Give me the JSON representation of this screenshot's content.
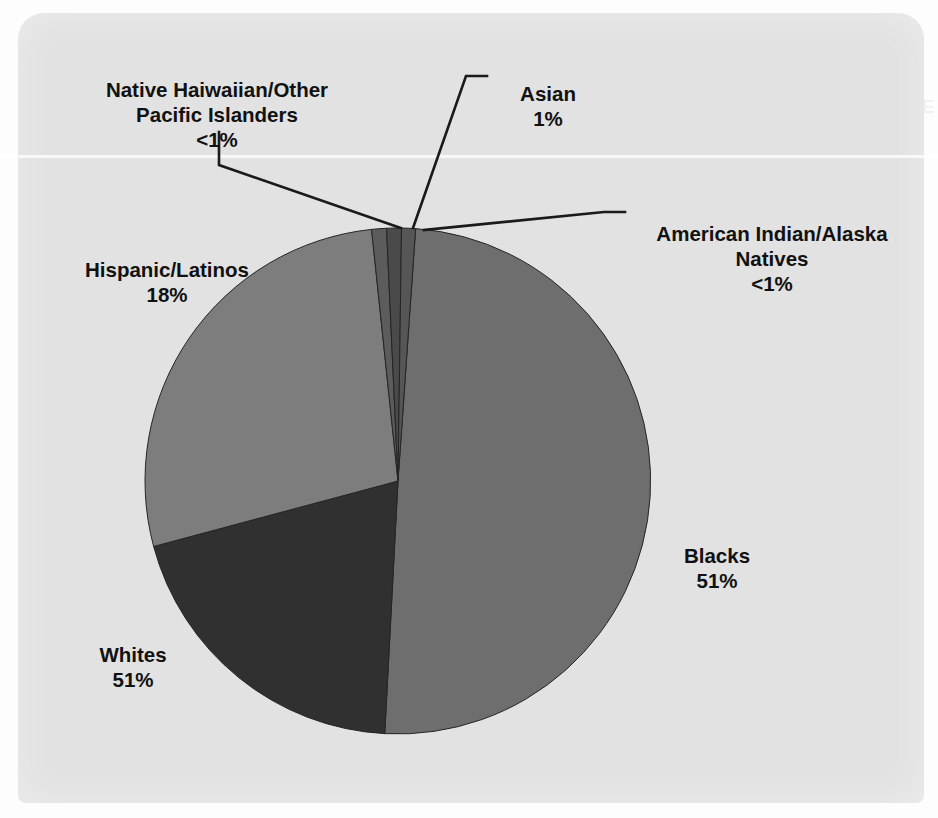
{
  "chart_data": {
    "type": "pie",
    "title": "",
    "subtitle": "",
    "xlabel": "",
    "ylabel": "",
    "legend_position": "none",
    "labels_position": "callout",
    "grid": false,
    "categories": [
      "Blacks",
      "Whites",
      "Hispanic/Latinos",
      "Asian",
      "Native Haiwaiian/Other Pacific Islanders",
      "American Indian/Alaska Natives"
    ],
    "values": [
      51,
      51,
      18,
      1,
      0.5,
      0.5
    ],
    "value_labels": [
      "51%",
      "51%",
      "18%",
      "1%",
      "<1%",
      "<1%"
    ],
    "colors": [
      "#6e6e6e",
      "#303030",
      "#7d7d7d",
      "#4a4a4a",
      "#5c5c5c",
      "#565656"
    ],
    "slices": [
      {
        "name": "Blacks",
        "value": 51,
        "value_label": "51%",
        "color": "#6e6e6e",
        "start_angle_deg": 4.0,
        "end_angle_deg": 183.0
      },
      {
        "name": "Whites",
        "value": 51,
        "value_label": "51%",
        "color": "#303030",
        "start_angle_deg": 183.0,
        "end_angle_deg": 255.0
      },
      {
        "name": "Hispanic/Latinos",
        "value": 18,
        "value_label": "18%",
        "color": "#7d7d7d",
        "start_angle_deg": 255.0,
        "end_angle_deg": 354.0
      },
      {
        "name": "Native Haiwaiian/Other Pacific Islanders",
        "value": 0.5,
        "value_label": "<1%",
        "color": "#5c5c5c",
        "start_angle_deg": 354.0,
        "end_angle_deg": 357.4
      },
      {
        "name": "Asian",
        "value": 1,
        "value_label": "1%",
        "color": "#4a4a4a",
        "start_angle_deg": 357.4,
        "end_angle_deg": 360.8
      },
      {
        "name": "American Indian/Alaska Natives",
        "value": 0.5,
        "value_label": "<1%",
        "color": "#565656",
        "start_angle_deg": 360.8,
        "end_angle_deg": 364.0
      }
    ]
  },
  "labels": {
    "nhopi": {
      "name": "Native Haiwaiian/Other\nPacific Islanders",
      "pct": "<1%"
    },
    "asian": {
      "name": "Asian",
      "pct": "1%"
    },
    "aian": {
      "name": "American Indian/Alaska\nNatives",
      "pct": "<1%"
    },
    "hispanic": {
      "name": "Hispanic/Latinos",
      "pct": "18%"
    },
    "whites": {
      "name": "Whites",
      "pct": "51%"
    },
    "blacks": {
      "name": "Blacks",
      "pct": "51%"
    }
  },
  "palette": {
    "page_background": "#fdfdfd",
    "panel_background": "#e2e2e2",
    "text": "#111111",
    "leader_line": "#1a1a1a",
    "blacks_slice": "#6e6e6e",
    "whites_slice": "#303030",
    "hispanic_slice": "#7d7d7d",
    "asian_slice": "#4a4a4a",
    "nhopi_slice": "#5c5c5c",
    "aian_slice": "#565656"
  },
  "ghost_text": {
    "line1": "CLOSE THE DISPARITY IN HEALTH CARE",
    "line2": "SOME NOTES ON THE",
    "line3": "more people in the",
    "line4": "racial and ethnic"
  }
}
